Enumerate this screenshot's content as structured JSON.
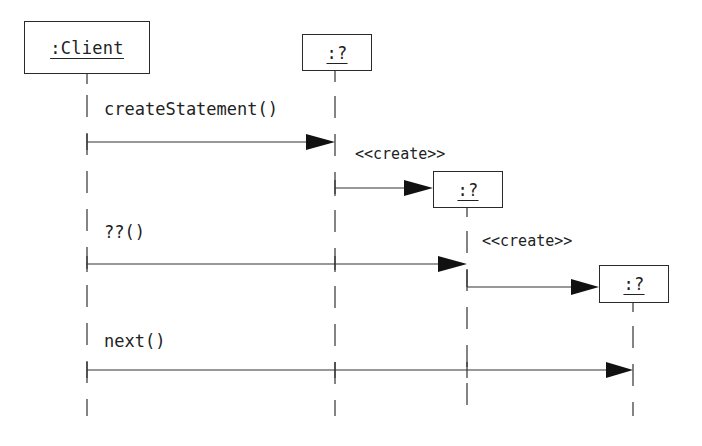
{
  "diagram": {
    "type": "sequence",
    "colors": {
      "line": "#333333",
      "text": "#222222",
      "background": "#ffffff"
    },
    "objects": [
      {
        "id": "client",
        "label": ":Client"
      },
      {
        "id": "obj1",
        "label": ":?"
      },
      {
        "id": "obj2",
        "label": ":?"
      },
      {
        "id": "obj3",
        "label": ":?"
      }
    ],
    "messages": [
      {
        "from": "client",
        "to": "obj1",
        "label": "createStatement()"
      },
      {
        "from": "obj1",
        "to": "obj2",
        "label": "<<create>>"
      },
      {
        "from": "client",
        "to": "obj2",
        "label": "??()"
      },
      {
        "from": "obj2",
        "to": "obj3",
        "label": "<<create>>"
      },
      {
        "from": "client",
        "to": "obj3",
        "label": "next()"
      }
    ]
  }
}
